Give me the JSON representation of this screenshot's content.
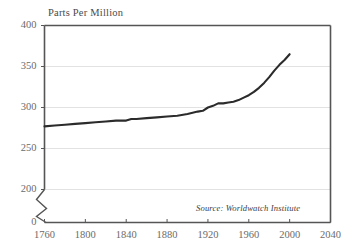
{
  "chart_data": {
    "type": "line",
    "title": "",
    "ylabel": "Parts Per Million",
    "xlabel": "",
    "ylim": [
      200,
      400
    ],
    "xlim": [
      1760,
      2040
    ],
    "grid": true,
    "legend": false,
    "y_axis_break": true,
    "y_break_label": "0",
    "yticks": [
      400,
      350,
      300,
      250,
      200
    ],
    "ytick_labels": [
      "400",
      "350",
      "300",
      "250",
      "200"
    ],
    "xticks": [
      1760,
      1800,
      1840,
      1880,
      1920,
      1960,
      2000,
      2040
    ],
    "xtick_labels": [
      "1760",
      "1800",
      "1840",
      "1880",
      "1920",
      "1960",
      "2000",
      "2040"
    ],
    "annotation": "Source: Worldwatch Institute",
    "series": [
      {
        "name": "Atmospheric CO2 Concentration",
        "x": [
          1760,
          1770,
          1780,
          1790,
          1800,
          1810,
          1820,
          1830,
          1840,
          1845,
          1850,
          1860,
          1870,
          1880,
          1890,
          1900,
          1910,
          1915,
          1920,
          1925,
          1930,
          1935,
          1940,
          1945,
          1950,
          1955,
          1960,
          1965,
          1970,
          1975,
          1980,
          1985,
          1990,
          1995,
          2000
        ],
        "values": [
          277,
          278,
          279,
          280,
          281,
          282,
          283,
          284,
          284,
          286,
          286,
          287,
          288,
          289,
          290,
          292,
          295,
          296,
          300,
          302,
          305,
          305,
          306,
          307,
          309,
          312,
          315,
          319,
          324,
          330,
          337,
          345,
          352,
          358,
          365
        ]
      }
    ],
    "colors": {
      "line": "#2b2b2b",
      "grid": "#e2e2e2",
      "axis": "#555555",
      "tick_text": "#6b6b6b",
      "background": "#ffffff"
    }
  },
  "labels": {
    "y_axis_title": "Parts Per Million",
    "source": "Source: Worldwatch Institute"
  }
}
